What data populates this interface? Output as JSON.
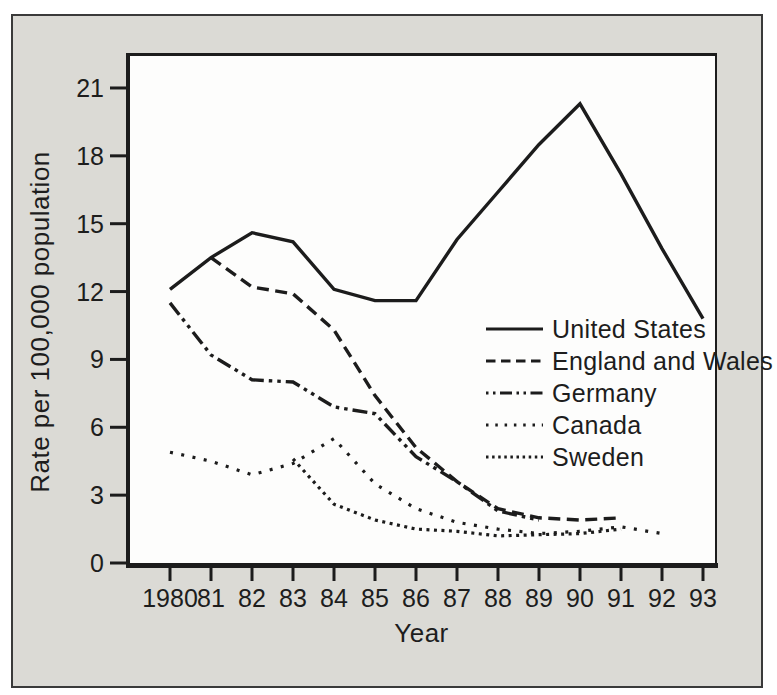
{
  "figure": {
    "background_color": "#dbdad5",
    "plot_background": "#fdfdfc",
    "ink_color": "#1c1c1c",
    "frame_color": "#3a3a3a"
  },
  "chart_data": {
    "type": "line",
    "title": "",
    "xlabel": "Year",
    "ylabel": "Rate per 100,000 population",
    "grid": false,
    "legend_position": "middle-right",
    "xlim": [
      1979,
      1993.5
    ],
    "ylim": [
      0,
      22
    ],
    "y_ticks": [
      0,
      3,
      6,
      9,
      12,
      15,
      18,
      21
    ],
    "y_tick_labels": [
      "0",
      "3",
      "6",
      "9",
      "12",
      "15",
      "18",
      "21"
    ],
    "x_ticks": [
      1980,
      1981,
      1982,
      1983,
      1984,
      1985,
      1986,
      1987,
      1988,
      1989,
      1990,
      1991,
      1992,
      1993
    ],
    "x_tick_labels": [
      "1980",
      "81",
      "82",
      "83",
      "84",
      "85",
      "86",
      "87",
      "88",
      "89",
      "90",
      "91",
      "92",
      "93"
    ],
    "series": [
      {
        "name": "United States",
        "style": "solid",
        "points": [
          [
            1980,
            12.1
          ],
          [
            1981,
            13.5
          ],
          [
            1982,
            14.6
          ],
          [
            1983,
            14.2
          ],
          [
            1984,
            12.1
          ],
          [
            1985,
            11.6
          ],
          [
            1986,
            11.6
          ],
          [
            1987,
            14.3
          ],
          [
            1988,
            16.4
          ],
          [
            1989,
            18.5
          ],
          [
            1990,
            20.3
          ],
          [
            1991,
            17.2
          ],
          [
            1992,
            13.9
          ],
          [
            1993,
            10.8
          ]
        ]
      },
      {
        "name": "England and Wales",
        "style": "dashed",
        "points": [
          [
            1981,
            13.5
          ],
          [
            1982,
            12.2
          ],
          [
            1983,
            11.9
          ],
          [
            1984,
            10.3
          ],
          [
            1985,
            7.4
          ],
          [
            1986,
            5.1
          ],
          [
            1987,
            3.6
          ],
          [
            1988,
            2.4
          ],
          [
            1989,
            2.0
          ],
          [
            1990,
            1.9
          ],
          [
            1991,
            2.0
          ]
        ]
      },
      {
        "name": "Germany",
        "style": "dash-dot-dot",
        "points": [
          [
            1980,
            11.5
          ],
          [
            1981,
            9.2
          ],
          [
            1982,
            8.1
          ],
          [
            1983,
            8.0
          ],
          [
            1984,
            6.9
          ],
          [
            1985,
            6.6
          ],
          [
            1986,
            4.7
          ],
          [
            1987,
            3.6
          ],
          [
            1988,
            2.3
          ],
          [
            1989,
            1.9
          ]
        ]
      },
      {
        "name": "Canada",
        "style": "dotted-sparse",
        "points": [
          [
            1980,
            4.9
          ],
          [
            1981,
            4.5
          ],
          [
            1982,
            3.9
          ],
          [
            1983,
            4.4
          ],
          [
            1984,
            5.5
          ],
          [
            1985,
            3.5
          ],
          [
            1986,
            2.4
          ],
          [
            1987,
            1.8
          ],
          [
            1988,
            1.5
          ],
          [
            1989,
            1.3
          ],
          [
            1990,
            1.4
          ],
          [
            1991,
            1.6
          ],
          [
            1992,
            1.3
          ]
        ]
      },
      {
        "name": "Sweden",
        "style": "dotted-dense",
        "points": [
          [
            1983,
            4.6
          ],
          [
            1984,
            2.6
          ],
          [
            1985,
            1.9
          ],
          [
            1986,
            1.5
          ],
          [
            1987,
            1.4
          ],
          [
            1988,
            1.2
          ],
          [
            1989,
            1.25
          ],
          [
            1990,
            1.3
          ],
          [
            1991,
            1.5
          ]
        ]
      }
    ]
  }
}
